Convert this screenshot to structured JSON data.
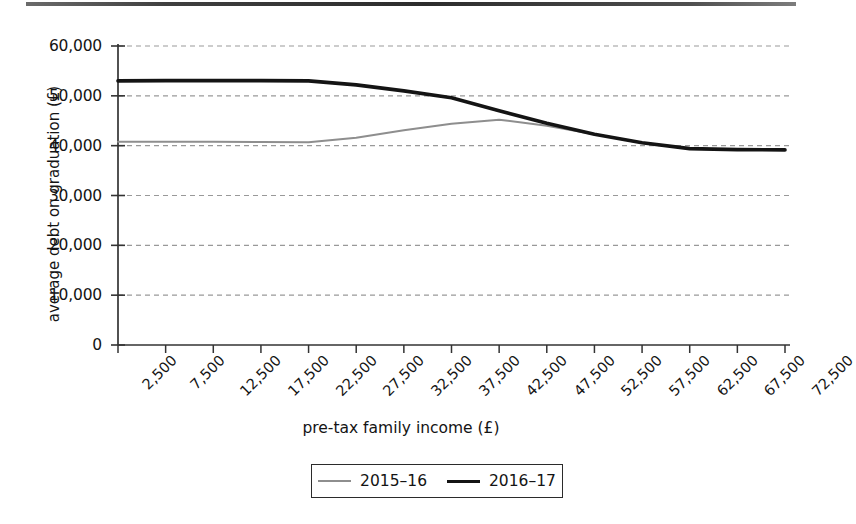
{
  "figure": {
    "top_rule": "page-rule"
  },
  "chart_data": {
    "type": "line",
    "title": "",
    "subtitle": "",
    "xlabel": "pre-tax family income (£)",
    "ylabel": "average debt on graduation (£)",
    "categories": [
      "2,500",
      "7,500",
      "12,500",
      "17,500",
      "22,500",
      "27,500",
      "32,500",
      "37,500",
      "42,500",
      "47,500",
      "52,500",
      "57,500",
      "62,500",
      "67,500",
      "72,500"
    ],
    "x": [
      2500,
      7500,
      12500,
      17500,
      22500,
      27500,
      32500,
      37500,
      42500,
      47500,
      52500,
      57500,
      62500,
      67500,
      72500
    ],
    "series": [
      {
        "name": "2015–16",
        "color": "#8e8e8e",
        "linewidth": 2.0,
        "values": [
          40800,
          40800,
          40800,
          40750,
          40700,
          41600,
          43100,
          44400,
          45200,
          44000,
          42300,
          40600,
          39400,
          39200,
          39150
        ]
      },
      {
        "name": "2016–17",
        "color": "#141414",
        "linewidth": 3.6,
        "values": [
          53000,
          53050,
          53050,
          53050,
          53000,
          52200,
          51000,
          49600,
          47000,
          44500,
          42300,
          40600,
          39400,
          39200,
          39150
        ]
      }
    ],
    "yticks": [
      0,
      10000,
      20000,
      30000,
      40000,
      50000,
      60000
    ],
    "ytick_labels": [
      "0",
      "10,000",
      "20,000",
      "30,000",
      "40,000",
      "50,000",
      "60,000"
    ],
    "ylim": [
      0,
      60000
    ],
    "xlim": [
      2500,
      72500
    ],
    "grid": {
      "horizontal": true,
      "vertical": false,
      "style": "dashed",
      "color": "#999999"
    },
    "legend": {
      "position": "below-axes",
      "entries": [
        "2015–16",
        "2016–17"
      ]
    },
    "axis": {
      "line_color": "#333333",
      "tick_color": "#333333"
    }
  }
}
